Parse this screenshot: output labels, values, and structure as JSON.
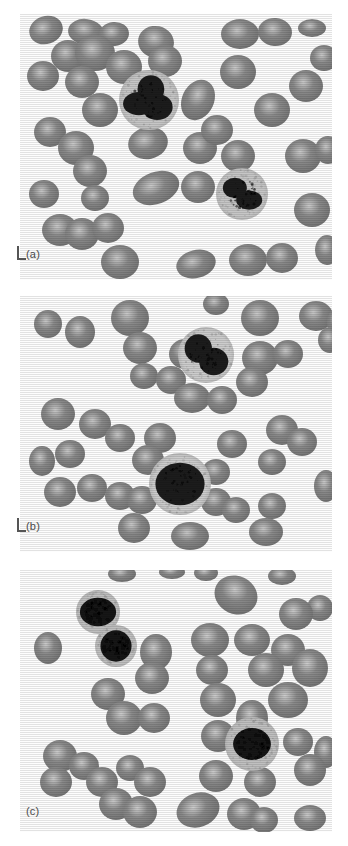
{
  "figure": {
    "background_color": "#ffffff",
    "width": 348,
    "height": 846
  },
  "panels": [
    {
      "id": "a",
      "label": "(a)",
      "has_scale_marker": true,
      "description": "Blood smear with two segmented neutrophils among red blood cells",
      "bounds": {
        "x": 20,
        "y": 14,
        "w": 312,
        "h": 266
      },
      "background_color": "#fdfdfd",
      "rbc_color": "#8a8a8a",
      "rbc_highlight_color": "#c9c9c9",
      "wbc_cytoplasm_color": "#c6c6c6",
      "wbc_nucleus_color": "#1f1f1f",
      "white_cells": [
        {
          "type": "neutrophil",
          "cx": 129,
          "cy": 86,
          "r": 30,
          "nucleus_lobes": 3
        },
        {
          "type": "neutrophil",
          "cx": 222,
          "cy": 180,
          "r": 26,
          "nucleus_lobes": 2
        }
      ],
      "red_cells": [
        {
          "cx": 26,
          "cy": 16,
          "rx": 17,
          "ry": 14,
          "rot": -18
        },
        {
          "cx": 66,
          "cy": 18,
          "rx": 18,
          "ry": 13,
          "rot": 8
        },
        {
          "cx": 94,
          "cy": 20,
          "rx": 15,
          "ry": 12,
          "rot": -5
        },
        {
          "cx": 136,
          "cy": 28,
          "rx": 18,
          "ry": 16,
          "rot": 12
        },
        {
          "cx": 220,
          "cy": 20,
          "rx": 19,
          "ry": 15,
          "rot": 0
        },
        {
          "cx": 255,
          "cy": 18,
          "rx": 17,
          "ry": 14,
          "rot": 4
        },
        {
          "cx": 292,
          "cy": 14,
          "rx": 14,
          "ry": 9,
          "rot": 0
        },
        {
          "cx": 23,
          "cy": 62,
          "rx": 16,
          "ry": 15,
          "rot": 0
        },
        {
          "cx": 48,
          "cy": 42,
          "rx": 17,
          "ry": 16,
          "rot": 0
        },
        {
          "cx": 75,
          "cy": 39,
          "rx": 20,
          "ry": 18,
          "rot": 0
        },
        {
          "cx": 62,
          "cy": 68,
          "rx": 17,
          "ry": 16,
          "rot": 0
        },
        {
          "cx": 104,
          "cy": 53,
          "rx": 18,
          "ry": 17,
          "rot": 0
        },
        {
          "cx": 145,
          "cy": 47,
          "rx": 17,
          "ry": 16,
          "rot": 0
        },
        {
          "cx": 80,
          "cy": 96,
          "rx": 18,
          "ry": 17,
          "rot": 0
        },
        {
          "cx": 178,
          "cy": 86,
          "rx": 16,
          "ry": 21,
          "rot": 25
        },
        {
          "cx": 218,
          "cy": 58,
          "rx": 18,
          "ry": 17,
          "rot": 0
        },
        {
          "cx": 252,
          "cy": 96,
          "rx": 18,
          "ry": 17,
          "rot": 0
        },
        {
          "cx": 286,
          "cy": 72,
          "rx": 17,
          "ry": 16,
          "rot": 0
        },
        {
          "cx": 304,
          "cy": 44,
          "rx": 14,
          "ry": 13,
          "rot": 0
        },
        {
          "cx": 30,
          "cy": 118,
          "rx": 16,
          "ry": 15,
          "rot": 0
        },
        {
          "cx": 56,
          "cy": 134,
          "rx": 18,
          "ry": 17,
          "rot": 0
        },
        {
          "cx": 70,
          "cy": 157,
          "rx": 17,
          "ry": 16,
          "rot": 0
        },
        {
          "cx": 24,
          "cy": 180,
          "rx": 15,
          "ry": 14,
          "rot": 0
        },
        {
          "cx": 75,
          "cy": 184,
          "rx": 14,
          "ry": 13,
          "rot": 0
        },
        {
          "cx": 128,
          "cy": 129,
          "rx": 20,
          "ry": 16,
          "rot": -12
        },
        {
          "cx": 180,
          "cy": 134,
          "rx": 17,
          "ry": 16,
          "rot": 0
        },
        {
          "cx": 197,
          "cy": 116,
          "rx": 16,
          "ry": 15,
          "rot": 0
        },
        {
          "cx": 218,
          "cy": 142,
          "rx": 17,
          "ry": 16,
          "rot": 0
        },
        {
          "cx": 283,
          "cy": 142,
          "rx": 18,
          "ry": 17,
          "rot": 0
        },
        {
          "cx": 308,
          "cy": 136,
          "rx": 13,
          "ry": 14,
          "rot": 0
        },
        {
          "cx": 136,
          "cy": 174,
          "rx": 24,
          "ry": 16,
          "rot": -20
        },
        {
          "cx": 178,
          "cy": 173,
          "rx": 17,
          "ry": 16,
          "rot": 0
        },
        {
          "cx": 292,
          "cy": 196,
          "rx": 18,
          "ry": 17,
          "rot": 0
        },
        {
          "cx": 40,
          "cy": 216,
          "rx": 18,
          "ry": 16,
          "rot": 0
        },
        {
          "cx": 62,
          "cy": 220,
          "rx": 17,
          "ry": 16,
          "rot": 0
        },
        {
          "cx": 88,
          "cy": 214,
          "rx": 16,
          "ry": 15,
          "rot": 0
        },
        {
          "cx": 100,
          "cy": 248,
          "rx": 19,
          "ry": 17,
          "rot": 0
        },
        {
          "cx": 176,
          "cy": 250,
          "rx": 20,
          "ry": 14,
          "rot": -14
        },
        {
          "cx": 228,
          "cy": 246,
          "rx": 19,
          "ry": 16,
          "rot": 0
        },
        {
          "cx": 262,
          "cy": 244,
          "rx": 16,
          "ry": 15,
          "rot": 0
        },
        {
          "cx": 307,
          "cy": 236,
          "rx": 12,
          "ry": 15,
          "rot": 0
        }
      ]
    },
    {
      "id": "b",
      "label": "(b)",
      "has_scale_marker": true,
      "description": "Blood smear with a band neutrophil and a monocyte among red blood cells",
      "bounds": {
        "x": 20,
        "y": 296,
        "w": 312,
        "h": 256
      },
      "background_color": "#fdfdfd",
      "rbc_color": "#8a8a8a",
      "rbc_highlight_color": "#c9c9c9",
      "wbc_cytoplasm_color": "#cccccc",
      "wbc_nucleus_color": "#1f1f1f",
      "white_cells": [
        {
          "type": "neutrophil",
          "cx": 186,
          "cy": 59,
          "r": 28,
          "nucleus_lobes": 2
        },
        {
          "type": "monocyte",
          "cx": 160,
          "cy": 188,
          "r": 31,
          "nucleus_lobes": 1
        }
      ],
      "red_cells": [
        {
          "cx": 28,
          "cy": 28,
          "rx": 14,
          "ry": 14,
          "rot": 0
        },
        {
          "cx": 60,
          "cy": 36,
          "rx": 15,
          "ry": 16,
          "rot": 0
        },
        {
          "cx": 110,
          "cy": 22,
          "rx": 19,
          "ry": 18,
          "rot": 0
        },
        {
          "cx": 120,
          "cy": 52,
          "rx": 17,
          "ry": 16,
          "rot": 0
        },
        {
          "cx": 196,
          "cy": 8,
          "rx": 13,
          "ry": 11,
          "rot": 0
        },
        {
          "cx": 240,
          "cy": 22,
          "rx": 19,
          "ry": 18,
          "rot": 0
        },
        {
          "cx": 296,
          "cy": 20,
          "rx": 17,
          "ry": 15,
          "rot": 0
        },
        {
          "cx": 318,
          "cy": 26,
          "rx": 11,
          "ry": 14,
          "rot": 0
        },
        {
          "cx": 165,
          "cy": 58,
          "rx": 16,
          "ry": 15,
          "rot": 0
        },
        {
          "cx": 240,
          "cy": 62,
          "rx": 18,
          "ry": 17,
          "rot": 0
        },
        {
          "cx": 268,
          "cy": 58,
          "rx": 15,
          "ry": 14,
          "rot": 0
        },
        {
          "cx": 310,
          "cy": 44,
          "rx": 12,
          "ry": 13,
          "rot": 0
        },
        {
          "cx": 124,
          "cy": 80,
          "rx": 14,
          "ry": 13,
          "rot": 0
        },
        {
          "cx": 151,
          "cy": 84,
          "rx": 15,
          "ry": 14,
          "rot": 0
        },
        {
          "cx": 232,
          "cy": 86,
          "rx": 16,
          "ry": 15,
          "rot": 0
        },
        {
          "cx": 172,
          "cy": 102,
          "rx": 18,
          "ry": 15,
          "rot": 0
        },
        {
          "cx": 202,
          "cy": 104,
          "rx": 15,
          "ry": 14,
          "rot": 0
        },
        {
          "cx": 38,
          "cy": 118,
          "rx": 17,
          "ry": 16,
          "rot": 0
        },
        {
          "cx": 75,
          "cy": 128,
          "rx": 16,
          "ry": 15,
          "rot": 0
        },
        {
          "cx": 100,
          "cy": 142,
          "rx": 15,
          "ry": 14,
          "rot": 0
        },
        {
          "cx": 140,
          "cy": 142,
          "rx": 16,
          "ry": 15,
          "rot": 0
        },
        {
          "cx": 22,
          "cy": 165,
          "rx": 13,
          "ry": 15,
          "rot": 0
        },
        {
          "cx": 50,
          "cy": 158,
          "rx": 15,
          "ry": 14,
          "rot": 0
        },
        {
          "cx": 212,
          "cy": 148,
          "rx": 15,
          "ry": 14,
          "rot": 0
        },
        {
          "cx": 262,
          "cy": 134,
          "rx": 16,
          "ry": 15,
          "rot": 0
        },
        {
          "cx": 282,
          "cy": 146,
          "rx": 15,
          "ry": 14,
          "rot": 0
        },
        {
          "cx": 252,
          "cy": 166,
          "rx": 14,
          "ry": 13,
          "rot": 0
        },
        {
          "cx": 40,
          "cy": 196,
          "rx": 16,
          "ry": 15,
          "rot": 0
        },
        {
          "cx": 72,
          "cy": 192,
          "rx": 15,
          "ry": 14,
          "rot": 0
        },
        {
          "cx": 100,
          "cy": 200,
          "rx": 15,
          "ry": 14,
          "rot": 0
        },
        {
          "cx": 128,
          "cy": 164,
          "rx": 16,
          "ry": 15,
          "rot": 0
        },
        {
          "cx": 122,
          "cy": 204,
          "rx": 15,
          "ry": 14,
          "rot": 0
        },
        {
          "cx": 196,
          "cy": 176,
          "rx": 14,
          "ry": 13,
          "rot": 0
        },
        {
          "cx": 196,
          "cy": 206,
          "rx": 15,
          "ry": 14,
          "rot": 0
        },
        {
          "cx": 216,
          "cy": 214,
          "rx": 14,
          "ry": 13,
          "rot": 0
        },
        {
          "cx": 306,
          "cy": 190,
          "rx": 12,
          "ry": 16,
          "rot": 0
        },
        {
          "cx": 114,
          "cy": 232,
          "rx": 16,
          "ry": 15,
          "rot": 0
        },
        {
          "cx": 170,
          "cy": 240,
          "rx": 19,
          "ry": 14,
          "rot": 0
        },
        {
          "cx": 246,
          "cy": 236,
          "rx": 17,
          "ry": 14,
          "rot": 0
        },
        {
          "cx": 252,
          "cy": 210,
          "rx": 14,
          "ry": 13,
          "rot": 0
        }
      ]
    },
    {
      "id": "c",
      "label": "(c)",
      "has_scale_marker": false,
      "description": "Blood smear with two lymphocytes and a large mononuclear cell among red blood cells",
      "bounds": {
        "x": 20,
        "y": 570,
        "w": 312,
        "h": 262
      },
      "background_color": "#fdfdfd",
      "rbc_color": "#8a8a8a",
      "rbc_highlight_color": "#cccccc",
      "wbc_cytoplasm_color": "#c0c0c0",
      "wbc_nucleus_color": "#121212",
      "white_cells": [
        {
          "type": "lymphocyte",
          "cx": 78,
          "cy": 42,
          "r": 22,
          "nucleus_lobes": 1
        },
        {
          "type": "lymphocyte",
          "cx": 96,
          "cy": 76,
          "r": 21,
          "nucleus_lobes": 1
        },
        {
          "type": "monocyte",
          "cx": 232,
          "cy": 174,
          "r": 27,
          "nucleus_lobes": 1
        }
      ],
      "red_cells": [
        {
          "cx": 102,
          "cy": 4,
          "rx": 14,
          "ry": 8,
          "rot": 0
        },
        {
          "cx": 152,
          "cy": 2,
          "rx": 13,
          "ry": 7,
          "rot": 0
        },
        {
          "cx": 186,
          "cy": 3,
          "rx": 12,
          "ry": 8,
          "rot": 0
        },
        {
          "cx": 262,
          "cy": 6,
          "rx": 14,
          "ry": 9,
          "rot": 0
        },
        {
          "cx": 216,
          "cy": 25,
          "rx": 22,
          "ry": 19,
          "rot": 25
        },
        {
          "cx": 300,
          "cy": 38,
          "rx": 13,
          "ry": 13,
          "rot": 0
        },
        {
          "cx": 276,
          "cy": 44,
          "rx": 17,
          "ry": 16,
          "rot": 0
        },
        {
          "cx": 28,
          "cy": 78,
          "rx": 14,
          "ry": 16,
          "rot": 0
        },
        {
          "cx": 190,
          "cy": 70,
          "rx": 19,
          "ry": 17,
          "rot": 0
        },
        {
          "cx": 232,
          "cy": 70,
          "rx": 18,
          "ry": 16,
          "rot": 0
        },
        {
          "cx": 268,
          "cy": 80,
          "rx": 17,
          "ry": 16,
          "rot": 0
        },
        {
          "cx": 136,
          "cy": 82,
          "rx": 16,
          "ry": 18,
          "rot": 0
        },
        {
          "cx": 132,
          "cy": 108,
          "rx": 17,
          "ry": 16,
          "rot": 0
        },
        {
          "cx": 192,
          "cy": 100,
          "rx": 16,
          "ry": 15,
          "rot": 0
        },
        {
          "cx": 246,
          "cy": 100,
          "rx": 18,
          "ry": 17,
          "rot": 0
        },
        {
          "cx": 290,
          "cy": 98,
          "rx": 18,
          "ry": 19,
          "rot": 0
        },
        {
          "cx": 88,
          "cy": 124,
          "rx": 17,
          "ry": 16,
          "rot": 0
        },
        {
          "cx": 104,
          "cy": 148,
          "rx": 18,
          "ry": 17,
          "rot": 0
        },
        {
          "cx": 134,
          "cy": 148,
          "rx": 16,
          "ry": 15,
          "rot": 0
        },
        {
          "cx": 198,
          "cy": 130,
          "rx": 18,
          "ry": 17,
          "rot": 0
        },
        {
          "cx": 268,
          "cy": 130,
          "rx": 20,
          "ry": 18,
          "rot": 0
        },
        {
          "cx": 198,
          "cy": 166,
          "rx": 17,
          "ry": 16,
          "rot": 0
        },
        {
          "cx": 232,
          "cy": 148,
          "rx": 16,
          "ry": 18,
          "rot": 0
        },
        {
          "cx": 278,
          "cy": 172,
          "rx": 15,
          "ry": 14,
          "rot": 0
        },
        {
          "cx": 40,
          "cy": 186,
          "rx": 17,
          "ry": 16,
          "rot": 0
        },
        {
          "cx": 36,
          "cy": 212,
          "rx": 16,
          "ry": 15,
          "rot": 0
        },
        {
          "cx": 64,
          "cy": 196,
          "rx": 15,
          "ry": 14,
          "rot": 0
        },
        {
          "cx": 82,
          "cy": 212,
          "rx": 16,
          "ry": 15,
          "rot": 0
        },
        {
          "cx": 306,
          "cy": 182,
          "rx": 12,
          "ry": 16,
          "rot": 0
        },
        {
          "cx": 196,
          "cy": 206,
          "rx": 17,
          "ry": 16,
          "rot": 0
        },
        {
          "cx": 240,
          "cy": 212,
          "rx": 16,
          "ry": 15,
          "rot": 0
        },
        {
          "cx": 290,
          "cy": 200,
          "rx": 16,
          "ry": 16,
          "rot": 0
        },
        {
          "cx": 110,
          "cy": 198,
          "rx": 14,
          "ry": 13,
          "rot": 0
        },
        {
          "cx": 130,
          "cy": 212,
          "rx": 16,
          "ry": 15,
          "rot": 0
        },
        {
          "cx": 96,
          "cy": 234,
          "rx": 17,
          "ry": 16,
          "rot": 0
        },
        {
          "cx": 120,
          "cy": 242,
          "rx": 17,
          "ry": 16,
          "rot": 0
        },
        {
          "cx": 178,
          "cy": 240,
          "rx": 22,
          "ry": 17,
          "rot": -20
        },
        {
          "cx": 224,
          "cy": 244,
          "rx": 17,
          "ry": 16,
          "rot": 0
        },
        {
          "cx": 244,
          "cy": 250,
          "rx": 14,
          "ry": 13,
          "rot": 0
        },
        {
          "cx": 290,
          "cy": 248,
          "rx": 16,
          "ry": 13,
          "rot": 0
        }
      ]
    }
  ]
}
